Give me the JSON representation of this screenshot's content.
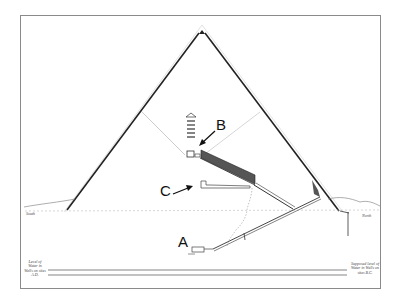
{
  "diagram": {
    "labels": [
      {
        "id": "A",
        "text": "A",
        "points_to": "subterranean chamber"
      },
      {
        "id": "B",
        "text": "B",
        "points_to": "upper chamber with relieving chambers"
      },
      {
        "id": "C",
        "text": "C",
        "points_to": "middle chamber"
      }
    ],
    "ground_labels": {
      "left": "South",
      "right": "North"
    },
    "water_level_notes": {
      "left": "Level of Water in Wells on sites A.D.",
      "right": "Supposed level of Water in Wells on sites B.C."
    }
  }
}
